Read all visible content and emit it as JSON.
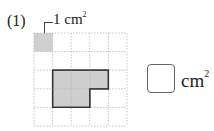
{
  "problem": {
    "number_label": "(1)",
    "unit_square_callout": {
      "value": "1 cm",
      "exponent": "2"
    },
    "grid": {
      "columns": 5,
      "rows": 5,
      "cell_area": "1 cm²"
    },
    "shaded_unit_cell": {
      "col": 0,
      "row": 0
    },
    "shape": {
      "description": "L-shaped polygon: 3 columns × 2 rows with bottom-right 1×1 cell removed",
      "vertices_in_cells": [
        [
          1,
          2
        ],
        [
          4,
          2
        ],
        [
          4,
          3
        ],
        [
          3,
          3
        ],
        [
          3,
          4
        ],
        [
          1,
          4
        ]
      ],
      "fill": "#cfcfcf",
      "stroke": "#333333"
    },
    "answer": {
      "value": "",
      "unit": "cm",
      "unit_exponent": "2"
    }
  }
}
